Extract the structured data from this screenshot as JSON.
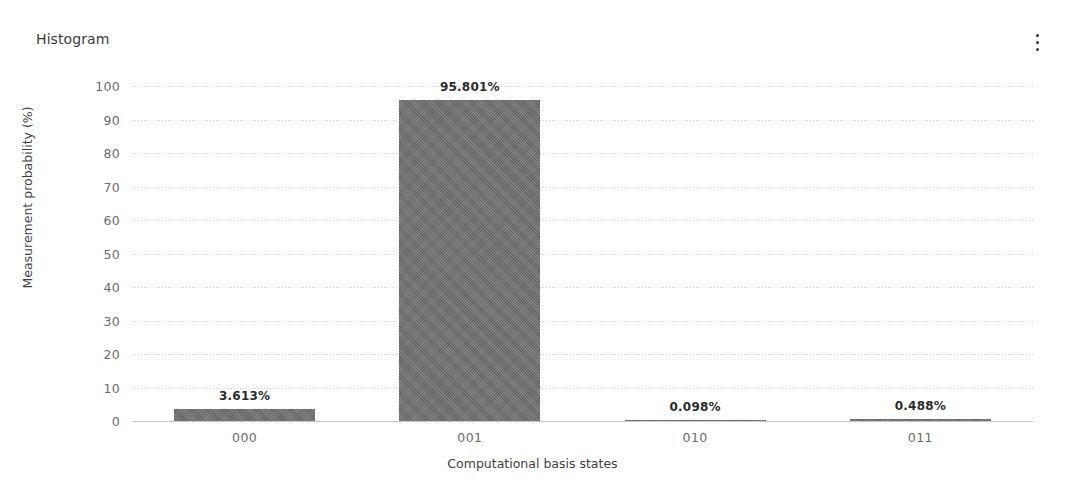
{
  "header": {
    "title": "Histogram",
    "menu_icon": "kebab-menu-icon"
  },
  "chart_data": {
    "type": "bar",
    "title": "Histogram",
    "xlabel": "Computational basis states",
    "ylabel": "Measurement probability (%)",
    "categories": [
      "000",
      "001",
      "010",
      "011"
    ],
    "values": [
      3.613,
      95.801,
      0.098,
      0.488
    ],
    "value_labels": [
      "3.613%",
      "95.801%",
      "0.098%",
      "0.488%"
    ],
    "ylim": [
      0,
      100
    ],
    "yticks": [
      100,
      90,
      80,
      70,
      60,
      50,
      40,
      30,
      20,
      10,
      0
    ],
    "ytick_labels": [
      "100",
      "90",
      "80",
      "70",
      "60",
      "50",
      "40",
      "30",
      "20",
      "10",
      "0"
    ],
    "grid": true,
    "legend": false,
    "bar_color": "#6f6f6f",
    "grid_color": "#d2d2d2",
    "axis_color": "#c8c8c8"
  }
}
